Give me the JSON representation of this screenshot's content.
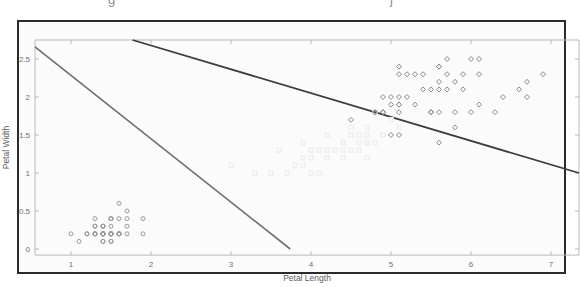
{
  "figure": {
    "top_clipped_text": "g                 j",
    "background_color": "#fbfbfb",
    "frame_color": "#2b2b2b"
  },
  "chart_data": {
    "type": "scatter",
    "title": "",
    "xlabel": "Petal Length",
    "ylabel": "Petal Width",
    "xlim": [
      0.55,
      7.35
    ],
    "ylim": [
      -0.08,
      2.75
    ],
    "xticks": [
      1,
      2,
      3,
      4,
      5,
      6,
      7
    ],
    "xticklabels": [
      "1",
      "2",
      "3",
      "4",
      "5",
      "6",
      "7"
    ],
    "yticks": [
      0,
      0.5,
      1,
      1.5,
      2,
      2.5
    ],
    "yticklabels": [
      "0",
      "0.5",
      "1",
      "1.5",
      "2",
      "2.5"
    ],
    "grid": false,
    "legend": null,
    "axis_color": "#b9b9b9",
    "series": [
      {
        "name": "setosa",
        "marker": "circle",
        "color": "#9a9a9a",
        "size": 4.0,
        "points": [
          [
            1.4,
            0.2
          ],
          [
            1.4,
            0.2
          ],
          [
            1.3,
            0.2
          ],
          [
            1.5,
            0.2
          ],
          [
            1.4,
            0.2
          ],
          [
            1.7,
            0.4
          ],
          [
            1.4,
            0.3
          ],
          [
            1.5,
            0.2
          ],
          [
            1.4,
            0.2
          ],
          [
            1.5,
            0.1
          ],
          [
            1.5,
            0.2
          ],
          [
            1.6,
            0.2
          ],
          [
            1.4,
            0.1
          ],
          [
            1.1,
            0.1
          ],
          [
            1.2,
            0.2
          ],
          [
            1.5,
            0.4
          ],
          [
            1.3,
            0.4
          ],
          [
            1.4,
            0.3
          ],
          [
            1.7,
            0.3
          ],
          [
            1.5,
            0.3
          ],
          [
            1.7,
            0.2
          ],
          [
            1.5,
            0.4
          ],
          [
            1.0,
            0.2
          ],
          [
            1.7,
            0.5
          ],
          [
            1.9,
            0.2
          ],
          [
            1.6,
            0.2
          ],
          [
            1.6,
            0.4
          ],
          [
            1.5,
            0.2
          ],
          [
            1.4,
            0.2
          ],
          [
            1.6,
            0.2
          ],
          [
            1.6,
            0.2
          ],
          [
            1.5,
            0.4
          ],
          [
            1.5,
            0.1
          ],
          [
            1.4,
            0.2
          ],
          [
            1.5,
            0.2
          ],
          [
            1.2,
            0.2
          ],
          [
            1.3,
            0.2
          ],
          [
            1.4,
            0.1
          ],
          [
            1.3,
            0.2
          ],
          [
            1.5,
            0.2
          ],
          [
            1.3,
            0.3
          ],
          [
            1.3,
            0.3
          ],
          [
            1.3,
            0.2
          ],
          [
            1.6,
            0.6
          ],
          [
            1.9,
            0.4
          ],
          [
            1.4,
            0.3
          ],
          [
            1.6,
            0.2
          ],
          [
            1.4,
            0.2
          ],
          [
            1.5,
            0.2
          ],
          [
            1.4,
            0.2
          ]
        ]
      },
      {
        "name": "versicolor",
        "marker": "square",
        "color": "#f0f0f0",
        "size": 4.0,
        "points": [
          [
            4.7,
            1.4
          ],
          [
            4.5,
            1.5
          ],
          [
            4.9,
            1.5
          ],
          [
            4.0,
            1.3
          ],
          [
            4.6,
            1.5
          ],
          [
            4.5,
            1.3
          ],
          [
            4.7,
            1.6
          ],
          [
            3.3,
            1.0
          ],
          [
            4.6,
            1.3
          ],
          [
            3.9,
            1.4
          ],
          [
            3.5,
            1.0
          ],
          [
            4.2,
            1.5
          ],
          [
            4.0,
            1.0
          ],
          [
            4.7,
            1.4
          ],
          [
            3.6,
            1.3
          ],
          [
            4.4,
            1.4
          ],
          [
            4.5,
            1.5
          ],
          [
            4.1,
            1.0
          ],
          [
            4.5,
            1.5
          ],
          [
            3.9,
            1.1
          ],
          [
            4.8,
            1.8
          ],
          [
            4.0,
            1.3
          ],
          [
            4.9,
            1.5
          ],
          [
            4.7,
            1.2
          ],
          [
            4.3,
            1.3
          ],
          [
            4.4,
            1.4
          ],
          [
            4.8,
            1.4
          ],
          [
            5.0,
            1.7
          ],
          [
            4.5,
            1.5
          ],
          [
            3.5,
            1.0
          ],
          [
            3.8,
            1.1
          ],
          [
            3.7,
            1.0
          ],
          [
            3.9,
            1.2
          ],
          [
            5.1,
            1.6
          ],
          [
            4.5,
            1.5
          ],
          [
            4.5,
            1.6
          ],
          [
            4.7,
            1.5
          ],
          [
            4.4,
            1.3
          ],
          [
            4.1,
            1.3
          ],
          [
            4.0,
            1.3
          ],
          [
            4.4,
            1.2
          ],
          [
            4.6,
            1.4
          ],
          [
            4.0,
            1.2
          ],
          [
            3.3,
            1.0
          ],
          [
            4.2,
            1.3
          ],
          [
            4.2,
            1.2
          ],
          [
            4.2,
            1.3
          ],
          [
            4.3,
            1.3
          ],
          [
            3.0,
            1.1
          ],
          [
            4.1,
            1.3
          ]
        ]
      },
      {
        "name": "virginica",
        "marker": "diamond",
        "color": "#8a8a8a",
        "size": 4.0,
        "points": [
          [
            6.0,
            2.5
          ],
          [
            5.1,
            1.9
          ],
          [
            5.9,
            2.1
          ],
          [
            5.6,
            1.8
          ],
          [
            5.8,
            2.2
          ],
          [
            6.6,
            2.1
          ],
          [
            4.5,
            1.7
          ],
          [
            6.3,
            1.8
          ],
          [
            5.8,
            1.8
          ],
          [
            6.1,
            2.5
          ],
          [
            5.1,
            2.0
          ],
          [
            5.3,
            1.9
          ],
          [
            5.5,
            2.1
          ],
          [
            5.0,
            2.0
          ],
          [
            5.1,
            2.4
          ],
          [
            5.3,
            2.3
          ],
          [
            5.5,
            1.8
          ],
          [
            6.7,
            2.2
          ],
          [
            6.9,
            2.3
          ],
          [
            5.0,
            1.5
          ],
          [
            5.7,
            2.3
          ],
          [
            4.9,
            2.0
          ],
          [
            6.7,
            2.0
          ],
          [
            4.9,
            1.8
          ],
          [
            5.7,
            2.1
          ],
          [
            6.0,
            1.8
          ],
          [
            4.8,
            1.8
          ],
          [
            4.9,
            1.8
          ],
          [
            5.6,
            2.1
          ],
          [
            5.8,
            1.6
          ],
          [
            6.1,
            1.9
          ],
          [
            6.4,
            2.0
          ],
          [
            5.6,
            2.2
          ],
          [
            5.1,
            1.5
          ],
          [
            5.6,
            1.4
          ],
          [
            6.1,
            2.3
          ],
          [
            5.6,
            2.4
          ],
          [
            5.5,
            1.8
          ],
          [
            4.8,
            1.8
          ],
          [
            5.4,
            2.1
          ],
          [
            5.6,
            2.4
          ],
          [
            5.1,
            2.3
          ],
          [
            5.1,
            1.9
          ],
          [
            5.9,
            2.3
          ],
          [
            5.7,
            2.5
          ],
          [
            5.2,
            2.3
          ],
          [
            5.0,
            1.9
          ],
          [
            5.2,
            2.0
          ],
          [
            5.4,
            2.3
          ],
          [
            5.1,
            1.8
          ]
        ]
      }
    ],
    "decision_lines": [
      {
        "name": "dark-boundary-line",
        "color": "#3c3c3c",
        "width": 1.8,
        "from": [
          1.77,
          2.75
        ],
        "to": [
          7.35,
          1.0
        ]
      },
      {
        "name": "gray-boundary-line",
        "color": "#6e6e6e",
        "width": 1.6,
        "from": [
          0.55,
          2.66
        ],
        "to": [
          3.74,
          0.0
        ]
      }
    ]
  }
}
